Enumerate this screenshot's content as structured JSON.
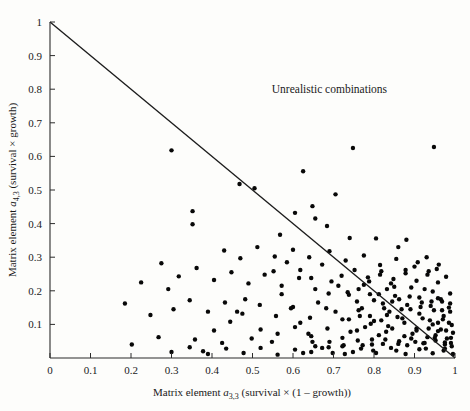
{
  "figure": {
    "background_color": "#fdfdfb",
    "ink_color": "#111111"
  },
  "chart_data": {
    "type": "scatter",
    "title": "",
    "xlabel": "Matrix element a3,3 (survival × (1 – growth))",
    "ylabel": "Matrix element a4,3 (survival × growth)",
    "xlabel_parts": {
      "prefix": "Matrix element ",
      "symbol": "a",
      "subscript": "3,3",
      "suffix": " (survival × (1 – growth))"
    },
    "ylabel_parts": {
      "prefix": "Matrix element ",
      "symbol": "a",
      "subscript": "4,3",
      "suffix": " (survival × growth)"
    },
    "xlim": [
      0,
      1
    ],
    "ylim": [
      0,
      1
    ],
    "xticks": [
      0,
      0.1,
      0.2,
      0.3,
      0.4,
      0.5,
      0.6,
      0.7,
      0.8,
      0.9,
      1
    ],
    "yticks": [
      0,
      0.1,
      0.2,
      0.3,
      0.4,
      0.5,
      0.6,
      0.7,
      0.8,
      0.9,
      1
    ],
    "xtick_labels": [
      "0",
      "0.1",
      "0.2",
      "0.3",
      "0.4",
      "0.5",
      "0.6",
      "0.7",
      "0.8",
      "0.9",
      "1"
    ],
    "ytick_labels": [
      "",
      "0.1",
      "0.2",
      "0.3",
      "0.4",
      "0.5",
      "0.6",
      "0.7",
      "0.8",
      "0.9",
      "1"
    ],
    "grid": false,
    "legend": false,
    "marker": {
      "shape": "circle",
      "color": "#080808",
      "radius": 2.2
    },
    "annotations": [
      {
        "text": "Unrealistic combinations",
        "x": 0.69,
        "y": 0.79
      }
    ],
    "reference_line": {
      "label": "x + y = 1",
      "from": [
        0,
        1
      ],
      "to": [
        1,
        0
      ],
      "color": "#1c1c1c"
    },
    "points": [
      [
        0.3,
        0.618
      ],
      [
        0.748,
        0.625
      ],
      [
        0.948,
        0.628
      ],
      [
        0.468,
        0.518
      ],
      [
        0.505,
        0.505
      ],
      [
        0.625,
        0.556
      ],
      [
        0.705,
        0.487
      ],
      [
        0.352,
        0.437
      ],
      [
        0.352,
        0.398
      ],
      [
        0.605,
        0.432
      ],
      [
        0.648,
        0.452
      ],
      [
        0.655,
        0.415
      ],
      [
        0.568,
        0.367
      ],
      [
        0.684,
        0.393
      ],
      [
        0.74,
        0.357
      ],
      [
        0.805,
        0.356
      ],
      [
        0.86,
        0.33
      ],
      [
        0.88,
        0.352
      ],
      [
        0.43,
        0.32
      ],
      [
        0.47,
        0.297
      ],
      [
        0.512,
        0.33
      ],
      [
        0.555,
        0.302
      ],
      [
        0.6,
        0.322
      ],
      [
        0.64,
        0.3
      ],
      [
        0.69,
        0.318
      ],
      [
        0.73,
        0.29
      ],
      [
        0.775,
        0.305
      ],
      [
        0.815,
        0.277
      ],
      [
        0.855,
        0.295
      ],
      [
        0.9,
        0.272
      ],
      [
        0.93,
        0.3
      ],
      [
        0.955,
        0.265
      ],
      [
        0.275,
        0.282
      ],
      [
        0.318,
        0.243
      ],
      [
        0.362,
        0.268
      ],
      [
        0.405,
        0.232
      ],
      [
        0.448,
        0.255
      ],
      [
        0.49,
        0.222
      ],
      [
        0.53,
        0.248
      ],
      [
        0.572,
        0.215
      ],
      [
        0.615,
        0.238
      ],
      [
        0.655,
        0.205
      ],
      [
        0.695,
        0.228
      ],
      [
        0.735,
        0.196
      ],
      [
        0.775,
        0.218
      ],
      [
        0.812,
        0.19
      ],
      [
        0.85,
        0.212
      ],
      [
        0.888,
        0.183
      ],
      [
        0.925,
        0.205
      ],
      [
        0.958,
        0.178
      ],
      [
        0.305,
        0.145
      ],
      [
        0.345,
        0.172
      ],
      [
        0.39,
        0.138
      ],
      [
        0.432,
        0.165
      ],
      [
        0.475,
        0.132
      ],
      [
        0.518,
        0.158
      ],
      [
        0.558,
        0.125
      ],
      [
        0.6,
        0.152
      ],
      [
        0.642,
        0.12
      ],
      [
        0.682,
        0.148
      ],
      [
        0.722,
        0.115
      ],
      [
        0.762,
        0.142
      ],
      [
        0.8,
        0.11
      ],
      [
        0.838,
        0.138
      ],
      [
        0.875,
        0.105
      ],
      [
        0.912,
        0.132
      ],
      [
        0.945,
        0.1
      ],
      [
        0.972,
        0.125
      ],
      [
        0.52,
        0.085
      ],
      [
        0.562,
        0.072
      ],
      [
        0.605,
        0.092
      ],
      [
        0.645,
        0.065
      ],
      [
        0.685,
        0.088
      ],
      [
        0.722,
        0.06
      ],
      [
        0.758,
        0.082
      ],
      [
        0.795,
        0.055
      ],
      [
        0.83,
        0.078
      ],
      [
        0.862,
        0.05
      ],
      [
        0.895,
        0.072
      ],
      [
        0.925,
        0.045
      ],
      [
        0.952,
        0.068
      ],
      [
        0.975,
        0.04
      ],
      [
        0.99,
        0.06
      ],
      [
        0.3,
        0.018
      ],
      [
        0.345,
        0.032
      ],
      [
        0.39,
        0.012
      ],
      [
        0.435,
        0.028
      ],
      [
        0.478,
        0.015
      ],
      [
        0.52,
        0.03
      ],
      [
        0.562,
        0.01
      ],
      [
        0.605,
        0.025
      ],
      [
        0.645,
        0.018
      ],
      [
        0.688,
        0.032
      ],
      [
        0.728,
        0.012
      ],
      [
        0.768,
        0.028
      ],
      [
        0.805,
        0.015
      ],
      [
        0.842,
        0.03
      ],
      [
        0.878,
        0.012
      ],
      [
        0.912,
        0.026
      ],
      [
        0.945,
        0.014
      ],
      [
        0.975,
        0.028
      ],
      [
        0.995,
        0.012
      ],
      [
        0.655,
        0.035
      ],
      [
        0.69,
        0.048
      ],
      [
        0.725,
        0.038
      ],
      [
        0.76,
        0.052
      ],
      [
        0.795,
        0.04
      ],
      [
        0.828,
        0.055
      ],
      [
        0.86,
        0.042
      ],
      [
        0.892,
        0.058
      ],
      [
        0.922,
        0.044
      ],
      [
        0.95,
        0.06
      ],
      [
        0.975,
        0.046
      ],
      [
        0.992,
        0.035
      ],
      [
        0.835,
        0.095
      ],
      [
        0.87,
        0.118
      ],
      [
        0.905,
        0.088
      ],
      [
        0.938,
        0.112
      ],
      [
        0.965,
        0.085
      ],
      [
        0.985,
        0.105
      ],
      [
        0.79,
        0.125
      ],
      [
        0.825,
        0.148
      ],
      [
        0.858,
        0.122
      ],
      [
        0.89,
        0.145
      ],
      [
        0.92,
        0.118
      ],
      [
        0.948,
        0.142
      ],
      [
        0.97,
        0.115
      ],
      [
        0.988,
        0.138
      ],
      [
        0.758,
        0.168
      ],
      [
        0.79,
        0.19
      ],
      [
        0.822,
        0.162
      ],
      [
        0.852,
        0.185
      ],
      [
        0.882,
        0.158
      ],
      [
        0.912,
        0.18
      ],
      [
        0.94,
        0.155
      ],
      [
        0.965,
        0.175
      ],
      [
        0.985,
        0.15
      ],
      [
        0.72,
        0.245
      ],
      [
        0.752,
        0.262
      ],
      [
        0.785,
        0.24
      ],
      [
        0.818,
        0.258
      ],
      [
        0.848,
        0.235
      ],
      [
        0.878,
        0.252
      ],
      [
        0.905,
        0.23
      ],
      [
        0.932,
        0.248
      ],
      [
        0.958,
        0.225
      ],
      [
        0.978,
        0.242
      ],
      [
        0.878,
        0.262
      ],
      [
        0.908,
        0.285
      ],
      [
        0.935,
        0.258
      ],
      [
        0.96,
        0.278
      ],
      [
        0.248,
        0.128
      ],
      [
        0.268,
        0.062
      ],
      [
        0.292,
        0.205
      ],
      [
        0.225,
        0.225
      ],
      [
        0.202,
        0.04
      ],
      [
        0.185,
        0.162
      ],
      [
        0.405,
        0.082
      ],
      [
        0.425,
        0.045
      ],
      [
        0.445,
        0.108
      ],
      [
        0.358,
        0.055
      ],
      [
        0.378,
        0.02
      ],
      [
        0.595,
        0.148
      ],
      [
        0.618,
        0.105
      ],
      [
        0.638,
        0.072
      ],
      [
        0.572,
        0.19
      ],
      [
        0.548,
        0.048
      ],
      [
        0.482,
        0.175
      ],
      [
        0.462,
        0.138
      ],
      [
        0.498,
        0.058
      ],
      [
        0.832,
        0.205
      ],
      [
        0.862,
        0.175
      ],
      [
        0.892,
        0.21
      ],
      [
        0.918,
        0.165
      ],
      [
        0.945,
        0.198
      ],
      [
        0.968,
        0.168
      ],
      [
        0.988,
        0.192
      ],
      [
        0.742,
        0.078
      ],
      [
        0.778,
        0.092
      ],
      [
        0.812,
        0.068
      ],
      [
        0.845,
        0.088
      ],
      [
        0.875,
        0.065
      ],
      [
        0.905,
        0.082
      ],
      [
        0.932,
        0.062
      ],
      [
        0.958,
        0.08
      ],
      [
        0.98,
        0.058
      ],
      [
        0.705,
        0.138
      ],
      [
        0.738,
        0.115
      ],
      [
        0.77,
        0.148
      ],
      [
        0.8,
        0.172
      ],
      [
        0.832,
        0.128
      ],
      [
        0.662,
        0.165
      ],
      [
        0.688,
        0.192
      ],
      [
        0.712,
        0.215
      ],
      [
        0.618,
        0.262
      ],
      [
        0.645,
        0.238
      ],
      [
        0.672,
        0.278
      ],
      [
        0.585,
        0.285
      ],
      [
        0.552,
        0.258
      ],
      [
        0.902,
        0.048
      ],
      [
        0.928,
        0.028
      ],
      [
        0.952,
        0.052
      ],
      [
        0.972,
        0.022
      ],
      [
        0.99,
        0.045
      ],
      [
        0.855,
        0.022
      ],
      [
        0.882,
        0.038
      ],
      [
        0.822,
        0.042
      ],
      [
        0.798,
        0.022
      ],
      [
        0.772,
        0.038
      ],
      [
        0.748,
        0.018
      ],
      [
        0.722,
        0.035
      ],
      [
        0.698,
        0.015
      ],
      [
        0.672,
        0.03
      ],
      [
        0.648,
        0.048
      ],
      [
        0.625,
        0.015
      ],
      [
        0.935,
        0.088
      ],
      [
        0.958,
        0.105
      ],
      [
        0.978,
        0.082
      ],
      [
        0.992,
        0.098
      ],
      [
        0.995,
        0.075
      ],
      [
        0.915,
        0.152
      ],
      [
        0.942,
        0.168
      ],
      [
        0.968,
        0.142
      ],
      [
        0.988,
        0.162
      ],
      [
        0.868,
        0.145
      ],
      [
        0.845,
        0.168
      ],
      [
        0.818,
        0.112
      ],
      [
        0.792,
        0.102
      ],
      [
        0.765,
        0.125
      ],
      [
        0.738,
        0.188
      ],
      [
        0.762,
        0.205
      ],
      [
        0.788,
        0.228
      ],
      [
        0.815,
        0.248
      ],
      [
        0.842,
        0.222
      ]
    ]
  }
}
